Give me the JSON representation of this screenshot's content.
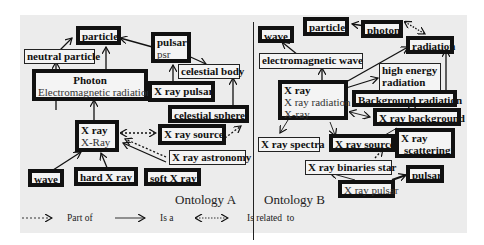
{
  "ontology_a": {
    "caption": "Ontology A",
    "nodes": {
      "particle": {
        "label": "particle"
      },
      "neutral_particle": {
        "label": "neutral particle"
      },
      "photon": {
        "label": "Photon",
        "synonym": "Electromagnetic radiation"
      },
      "pulsar": {
        "label": "pulsar",
        "synonym": "psr"
      },
      "celestial_body": {
        "label": "celestial body"
      },
      "x_ray_pulsar": {
        "label": "X ray pulsar"
      },
      "celestial_sphere": {
        "label": "celestial sphere"
      },
      "x_ray": {
        "label": "X ray",
        "synonym": "X-Ray"
      },
      "x_ray_source": {
        "label": "X ray source"
      },
      "x_ray_astronomy": {
        "label": "X ray astronomy"
      },
      "wave": {
        "label": "wave"
      },
      "hard_x_ray": {
        "label": "hard X ray"
      },
      "soft_x_ray": {
        "label": "soft X ray"
      }
    }
  },
  "ontology_b": {
    "caption": "Ontology B",
    "nodes": {
      "wave": {
        "label": "wave"
      },
      "particle": {
        "label": "particle"
      },
      "photon": {
        "label": "photon"
      },
      "radiation": {
        "label": "radiation"
      },
      "electromagnetic_wave": {
        "label": "electromagnetic wave"
      },
      "high_energy_radiation": {
        "label": "high energy",
        "label2": "radiation"
      },
      "x_ray": {
        "label": "X ray",
        "synonym": "X ray radiation",
        "synonym2": "X-ray"
      },
      "background_radiation": {
        "label": "Background radiation"
      },
      "x_ray_background": {
        "label": "X ray background"
      },
      "x_ray_spectra": {
        "label": "X ray spectra"
      },
      "x_ray_source": {
        "label": "X ray source"
      },
      "x_ray_scattering": {
        "label": "X ray",
        "label2": "scattering"
      },
      "x_ray_binaries_star": {
        "label": "X ray binaries star"
      },
      "pulsar": {
        "label": "pulsar"
      },
      "x_ray_pulsar": {
        "label": "X ray pulsar"
      }
    }
  },
  "legend": {
    "part_of": "Part of",
    "is_a": "Is a",
    "is_related_to": "Is related  to"
  },
  "colors": {
    "panel_bg": "#ececec",
    "box_border": "#111111",
    "text": "#111111"
  }
}
